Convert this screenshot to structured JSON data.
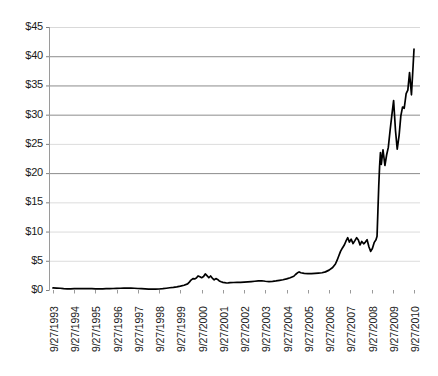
{
  "chart_data": {
    "type": "line",
    "title": "",
    "subtitle": "",
    "xlabel": "",
    "ylabel": "",
    "ylim": [
      0,
      45
    ],
    "grid": true,
    "legend": null,
    "y_ticks": [
      "$0",
      "$5",
      "$10",
      "$15",
      "$20",
      "$25",
      "$30",
      "$35",
      "$40",
      "$45"
    ],
    "y_tick_values": [
      0,
      5,
      10,
      15,
      20,
      25,
      30,
      35,
      40,
      45
    ],
    "x_tick_labels": [
      "9/27/1993",
      "9/27/1994",
      "9/27/1995",
      "9/27/1996",
      "9/27/1997",
      "9/27/1998",
      "9/27/1999",
      "9/27/2000",
      "9/27/2001",
      "9/27/2002",
      "9/27/2003",
      "9/27/2004",
      "9/27/2005",
      "9/27/2006",
      "9/27/2007",
      "9/27/2008",
      "9/27/2009",
      "9/27/2010"
    ],
    "series_name": "Share price",
    "line_color": "#000000",
    "x": [
      1993.74,
      1993.91,
      1994.08,
      1994.24,
      1994.41,
      1994.57,
      1994.74,
      1994.91,
      1995.08,
      1995.24,
      1995.41,
      1995.57,
      1995.74,
      1995.91,
      1996.08,
      1996.24,
      1996.41,
      1996.57,
      1996.74,
      1996.91,
      1997.08,
      1997.24,
      1997.41,
      1997.57,
      1997.74,
      1997.91,
      1998.08,
      1998.24,
      1998.41,
      1998.57,
      1998.74,
      1998.91,
      1999.08,
      1999.24,
      1999.41,
      1999.57,
      1999.74,
      1999.91,
      2000.08,
      2000.16,
      2000.24,
      2000.33,
      2000.41,
      2000.49,
      2000.57,
      2000.66,
      2000.74,
      2000.83,
      2000.91,
      2000.99,
      2001.08,
      2001.16,
      2001.24,
      2001.33,
      2001.41,
      2001.49,
      2001.57,
      2001.66,
      2001.74,
      2001.83,
      2001.91,
      2001.99,
      2002.08,
      2002.24,
      2002.41,
      2002.57,
      2002.74,
      2002.91,
      2003.08,
      2003.24,
      2003.41,
      2003.57,
      2003.74,
      2003.91,
      2004.08,
      2004.24,
      2004.41,
      2004.57,
      2004.74,
      2004.91,
      2005.08,
      2005.16,
      2005.24,
      2005.33,
      2005.41,
      2005.57,
      2005.74,
      2005.91,
      2006.08,
      2006.24,
      2006.41,
      2006.57,
      2006.74,
      2006.91,
      2007.04,
      2007.12,
      2007.2,
      2007.28,
      2007.37,
      2007.45,
      2007.53,
      2007.62,
      2007.7,
      2007.78,
      2007.87,
      2007.95,
      2008.04,
      2008.12,
      2008.2,
      2008.28,
      2008.37,
      2008.45,
      2008.53,
      2008.62,
      2008.7,
      2008.78,
      2008.87,
      2008.95,
      2009.0,
      2009.04,
      2009.08,
      2009.12,
      2009.16,
      2009.2,
      2009.28,
      2009.37,
      2009.45,
      2009.53,
      2009.62,
      2009.7,
      2009.78,
      2009.87,
      2009.95,
      2010.04,
      2010.12,
      2010.2,
      2010.28,
      2010.37,
      2010.45,
      2010.53,
      2010.62,
      2010.7,
      2010.74
    ],
    "values": [
      0.35,
      0.33,
      0.3,
      0.22,
      0.18,
      0.2,
      0.22,
      0.22,
      0.22,
      0.23,
      0.24,
      0.22,
      0.2,
      0.2,
      0.2,
      0.22,
      0.24,
      0.26,
      0.28,
      0.3,
      0.32,
      0.34,
      0.33,
      0.3,
      0.26,
      0.22,
      0.18,
      0.15,
      0.14,
      0.15,
      0.17,
      0.22,
      0.3,
      0.38,
      0.46,
      0.55,
      0.66,
      0.82,
      1.05,
      1.35,
      1.7,
      1.95,
      1.9,
      2.05,
      2.4,
      2.25,
      2.1,
      2.3,
      2.75,
      2.45,
      2.1,
      2.4,
      2.05,
      1.75,
      1.95,
      1.8,
      1.55,
      1.4,
      1.3,
      1.25,
      1.2,
      1.22,
      1.25,
      1.28,
      1.32,
      1.3,
      1.35,
      1.4,
      1.45,
      1.5,
      1.55,
      1.58,
      1.5,
      1.45,
      1.48,
      1.55,
      1.65,
      1.75,
      1.9,
      2.1,
      2.35,
      2.65,
      2.9,
      3.1,
      2.95,
      2.85,
      2.8,
      2.8,
      2.85,
      2.9,
      2.95,
      3.1,
      3.4,
      3.85,
      4.45,
      5.1,
      5.85,
      6.6,
      7.2,
      7.65,
      8.3,
      8.95,
      8.2,
      8.7,
      7.95,
      8.4,
      8.95,
      8.55,
      7.7,
      8.3,
      7.9,
      8.2,
      8.6,
      7.35,
      6.6,
      7.1,
      8.15,
      8.6,
      9.2,
      13.5,
      17.8,
      21.2,
      23.5,
      21.5,
      24.0,
      21.3,
      23.1,
      24.4,
      27.5,
      30.0,
      32.4,
      27.2,
      24.1,
      26.5,
      29.8,
      31.3,
      31.1,
      33.6,
      34.2,
      37.2,
      33.4,
      38.5,
      41.2
    ]
  }
}
